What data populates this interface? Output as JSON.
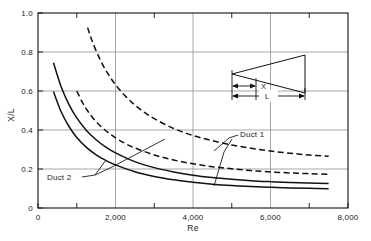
{
  "chart_data": {
    "type": "line",
    "title": "",
    "xlabel": "Re",
    "ylabel": "X/L",
    "xlim": [
      0,
      8000
    ],
    "ylim": [
      0,
      1.0
    ],
    "grid": true,
    "x_ticks": [
      0,
      2000,
      4000,
      6000,
      8000
    ],
    "x_tick_labels": [
      "0",
      "2,000",
      "4,000",
      "6,000",
      "8,000"
    ],
    "x_minor_ticks": [
      1000,
      3000,
      5000,
      7000
    ],
    "y_ticks": [
      0,
      0.2,
      0.4,
      0.6,
      0.8,
      1.0
    ],
    "y_tick_labels": [
      "0",
      "0.2",
      "0.4",
      "0.6",
      "0.8",
      "1.0"
    ],
    "legend_position": "inline-annotations",
    "annotations": [
      {
        "name": "duct-1-label",
        "text": "Duct 1",
        "x": 4500,
        "y": 0.345
      },
      {
        "name": "duct-2-label",
        "text": "Duct 2",
        "x": 520,
        "y": 0.175
      }
    ],
    "series": [
      {
        "name": "Duct 2 upper",
        "style": "solid",
        "color": "#111111",
        "points": [
          [
            400,
            0.745
          ],
          [
            600,
            0.62
          ],
          [
            800,
            0.53
          ],
          [
            1000,
            0.462
          ],
          [
            1250,
            0.398
          ],
          [
            1500,
            0.35
          ],
          [
            1750,
            0.312
          ],
          [
            2000,
            0.283
          ],
          [
            2500,
            0.238
          ],
          [
            3000,
            0.207
          ],
          [
            3500,
            0.185
          ],
          [
            4000,
            0.168
          ],
          [
            4500,
            0.156
          ],
          [
            5000,
            0.147
          ],
          [
            5500,
            0.14
          ],
          [
            6000,
            0.135
          ],
          [
            6500,
            0.131
          ],
          [
            7000,
            0.128
          ],
          [
            7500,
            0.126
          ]
        ]
      },
      {
        "name": "Duct 2 lower",
        "style": "solid",
        "color": "#111111",
        "points": [
          [
            400,
            0.597
          ],
          [
            600,
            0.492
          ],
          [
            800,
            0.418
          ],
          [
            1000,
            0.362
          ],
          [
            1250,
            0.311
          ],
          [
            1500,
            0.273
          ],
          [
            1750,
            0.244
          ],
          [
            2000,
            0.221
          ],
          [
            2500,
            0.186
          ],
          [
            3000,
            0.162
          ],
          [
            3500,
            0.145
          ],
          [
            4000,
            0.132
          ],
          [
            4500,
            0.122
          ],
          [
            5000,
            0.115
          ],
          [
            5500,
            0.11
          ],
          [
            6000,
            0.106
          ],
          [
            6500,
            0.103
          ],
          [
            7000,
            0.101
          ],
          [
            7500,
            0.099
          ]
        ]
      },
      {
        "name": "Duct 1 upper",
        "style": "dashed",
        "color": "#111111",
        "points": [
          [
            1280,
            0.925
          ],
          [
            1400,
            0.855
          ],
          [
            1600,
            0.762
          ],
          [
            1800,
            0.69
          ],
          [
            2000,
            0.632
          ],
          [
            2250,
            0.575
          ],
          [
            2500,
            0.528
          ],
          [
            2750,
            0.49
          ],
          [
            3000,
            0.458
          ],
          [
            3500,
            0.408
          ],
          [
            4000,
            0.372
          ],
          [
            4500,
            0.345
          ],
          [
            5000,
            0.323
          ],
          [
            5500,
            0.306
          ],
          [
            6000,
            0.292
          ],
          [
            6500,
            0.281
          ],
          [
            7000,
            0.272
          ],
          [
            7500,
            0.265
          ]
        ]
      },
      {
        "name": "Duct 1 lower",
        "style": "dashed",
        "color": "#111111",
        "points": [
          [
            1000,
            0.6
          ],
          [
            1150,
            0.54
          ],
          [
            1300,
            0.492
          ],
          [
            1500,
            0.443
          ],
          [
            1750,
            0.396
          ],
          [
            2000,
            0.36
          ],
          [
            2250,
            0.331
          ],
          [
            2500,
            0.308
          ],
          [
            3000,
            0.272
          ],
          [
            3500,
            0.246
          ],
          [
            4000,
            0.227
          ],
          [
            4500,
            0.212
          ],
          [
            5000,
            0.201
          ],
          [
            5500,
            0.192
          ],
          [
            6000,
            0.185
          ],
          [
            6500,
            0.18
          ],
          [
            7000,
            0.176
          ],
          [
            7500,
            0.173
          ]
        ]
      }
    ]
  },
  "inset": {
    "name": "duct-geometry-diagram",
    "x_label": "X",
    "l_label": "L"
  }
}
